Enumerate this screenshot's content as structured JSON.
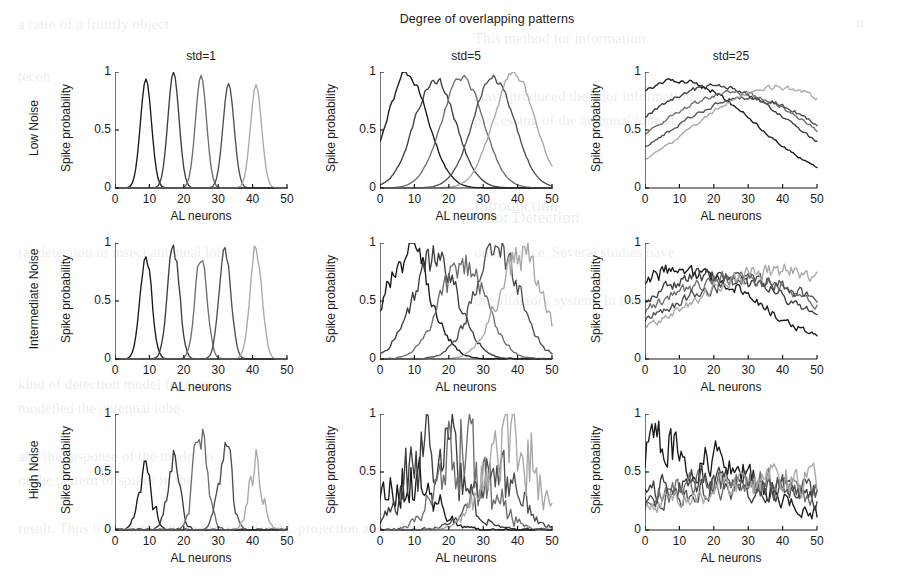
{
  "figure": {
    "title": "Degree of overlapping patterns",
    "columns": [
      {
        "id": "std1",
        "label": "std=1"
      },
      {
        "id": "std5",
        "label": "std=5"
      },
      {
        "id": "std25",
        "label": "std=25"
      }
    ],
    "rows": [
      {
        "id": "low",
        "label": "Low Noise"
      },
      {
        "id": "mid",
        "label": "Intermediate Noise"
      },
      {
        "id": "high",
        "label": "High Noise"
      }
    ],
    "axis": {
      "xlabel": "AL neurons",
      "ylabel": "Spike probability",
      "xticks": [
        0,
        10,
        20,
        30,
        40,
        50
      ],
      "yticks": [
        0,
        0.5,
        1
      ],
      "xlim": [
        0,
        50
      ],
      "ylim": [
        0,
        1
      ]
    },
    "trace_colors": [
      "#1a1a1a",
      "#3d3d3d",
      "#6e6e6e",
      "#4f4f4f",
      "#a8a8a8"
    ],
    "n_traces": 5
  },
  "bleed_text": [
    {
      "text": "a   ratio   of a   fruitfly   object",
      "x": 18,
      "y": 16,
      "size": 15
    },
    {
      "text": "n",
      "x": 856,
      "y": 14,
      "size": 15
    },
    {
      "text": "This  method  for  information",
      "x": 474,
      "y": 30,
      "size": 15
    },
    {
      "text": "tecon",
      "x": 18,
      "y": 68,
      "size": 15
    },
    {
      "text": "Have  produced  the  odor  information",
      "x": 474,
      "y": 88,
      "size": 15
    },
    {
      "text": "processing  of the  antennal  lobe  and",
      "x": 474,
      "y": 112,
      "size": 15
    },
    {
      "text": "Introduction",
      "x": 474,
      "y": 196,
      "size": 17
    },
    {
      "text": "ral  detection  in  insect  antennal  lobe",
      "x": 18,
      "y": 244,
      "size": 15
    },
    {
      "text": "odor  source.  Several  studies  have",
      "x": 474,
      "y": 244,
      "size": 15
    },
    {
      "text": "the  olfactory  system.  In  this  study",
      "x": 474,
      "y": 292,
      "size": 15
    },
    {
      "text": "kind  of  detection  model  for  signals",
      "x": 18,
      "y": 376,
      "size": 15
    },
    {
      "text": "modelled  the  antennal  lobe",
      "x": 18,
      "y": 400,
      "size": 15
    },
    {
      "text": "and  the  response  of  the  model  to",
      "x": 18,
      "y": 448,
      "size": 15
    },
    {
      "text": "of  the  pattern  of  spikes  in  the",
      "x": 18,
      "y": 472,
      "size": 15
    },
    {
      "text": "result.  Thus  it  is  a  fine-tune  expression  for  AL  projection  and  selected",
      "x": 18,
      "y": 520,
      "size": 15
    },
    {
      "text": "Odor  Detection",
      "x": 474,
      "y": 208,
      "size": 17
    }
  ],
  "chart_data": [
    {
      "type": "line",
      "panel": "Low Noise / std=1",
      "row": "Low Noise",
      "column": "std=1",
      "title": "std=1",
      "xlabel": "AL neurons",
      "ylabel": "Spike probability",
      "xlim": [
        0,
        50
      ],
      "ylim": [
        0,
        1
      ],
      "grid": false,
      "legend": false,
      "series": [
        {
          "name": "pattern 1",
          "color": "#1a1a1a",
          "center": 9,
          "sigma": 1.6,
          "amplitude": 0.94,
          "noise": 0.0
        },
        {
          "name": "pattern 2",
          "color": "#3d3d3d",
          "center": 17,
          "sigma": 1.6,
          "amplitude": 1.0,
          "noise": 0.0
        },
        {
          "name": "pattern 3",
          "color": "#6e6e6e",
          "center": 25,
          "sigma": 1.6,
          "amplitude": 0.97,
          "noise": 0.0
        },
        {
          "name": "pattern 4",
          "color": "#4f4f4f",
          "center": 33,
          "sigma": 1.6,
          "amplitude": 0.9,
          "noise": 0.0
        },
        {
          "name": "pattern 5",
          "color": "#a8a8a8",
          "center": 41,
          "sigma": 1.6,
          "amplitude": 0.89,
          "noise": 0.0
        }
      ]
    },
    {
      "type": "line",
      "panel": "Low Noise / std=5",
      "row": "Low Noise",
      "column": "std=5",
      "title": "std=5",
      "xlabel": "AL neurons",
      "ylabel": "Spike probability",
      "xlim": [
        0,
        50
      ],
      "ylim": [
        0,
        1
      ],
      "grid": false,
      "legend": false,
      "series": [
        {
          "name": "pattern 1",
          "color": "#1a1a1a",
          "center": 8,
          "sigma": 6.0,
          "amplitude": 1.0,
          "noise": 0.05
        },
        {
          "name": "pattern 2",
          "color": "#3d3d3d",
          "center": 16,
          "sigma": 6.0,
          "amplitude": 0.95,
          "noise": 0.05
        },
        {
          "name": "pattern 3",
          "color": "#6e6e6e",
          "center": 24,
          "sigma": 6.0,
          "amplitude": 0.97,
          "noise": 0.05
        },
        {
          "name": "pattern 4",
          "color": "#4f4f4f",
          "center": 33,
          "sigma": 6.0,
          "amplitude": 0.97,
          "noise": 0.05
        },
        {
          "name": "pattern 5",
          "color": "#a8a8a8",
          "center": 39,
          "sigma": 6.0,
          "amplitude": 1.0,
          "noise": 0.05
        }
      ]
    },
    {
      "type": "line",
      "panel": "Low Noise / std=25",
      "row": "Low Noise",
      "column": "std=25",
      "title": "std=25",
      "xlabel": "AL neurons",
      "ylabel": "Spike probability",
      "xlim": [
        0,
        50
      ],
      "ylim": [
        0,
        1
      ],
      "grid": false,
      "legend": false,
      "series": [
        {
          "name": "pattern 1",
          "color": "#1a1a1a",
          "center": 10,
          "sigma": 22.0,
          "amplitude": 0.95,
          "noise": 0.09
        },
        {
          "name": "pattern 2",
          "color": "#3d3d3d",
          "center": 20,
          "sigma": 24.0,
          "amplitude": 0.9,
          "noise": 0.09
        },
        {
          "name": "pattern 3",
          "color": "#6e6e6e",
          "center": 26,
          "sigma": 24.0,
          "amplitude": 0.85,
          "noise": 0.09
        },
        {
          "name": "pattern 4",
          "color": "#4f4f4f",
          "center": 30,
          "sigma": 24.0,
          "amplitude": 0.8,
          "noise": 0.09
        },
        {
          "name": "pattern 5",
          "color": "#a8a8a8",
          "center": 38,
          "sigma": 24.0,
          "amplitude": 0.9,
          "noise": 0.09
        }
      ]
    },
    {
      "type": "line",
      "panel": "Intermediate Noise / std=1",
      "row": "Intermediate Noise",
      "column": "std=1",
      "title": "std=1",
      "xlabel": "AL neurons",
      "ylabel": "Spike probability",
      "xlim": [
        0,
        50
      ],
      "ylim": [
        0,
        1
      ],
      "grid": false,
      "legend": false,
      "series": [
        {
          "name": "pattern 1",
          "color": "#1a1a1a",
          "center": 9,
          "sigma": 1.7,
          "amplitude": 0.88,
          "noise": 0.1
        },
        {
          "name": "pattern 2",
          "color": "#3d3d3d",
          "center": 17,
          "sigma": 1.7,
          "amplitude": 1.0,
          "noise": 0.1
        },
        {
          "name": "pattern 3",
          "color": "#6e6e6e",
          "center": 25,
          "sigma": 1.7,
          "amplitude": 0.92,
          "noise": 0.1
        },
        {
          "name": "pattern 4",
          "color": "#4f4f4f",
          "center": 32,
          "sigma": 1.7,
          "amplitude": 0.94,
          "noise": 0.1
        },
        {
          "name": "pattern 5",
          "color": "#a8a8a8",
          "center": 41,
          "sigma": 1.7,
          "amplitude": 0.98,
          "noise": 0.1
        }
      ]
    },
    {
      "type": "line",
      "panel": "Intermediate Noise / std=5",
      "row": "Intermediate Noise",
      "column": "std=5",
      "title": "std=5",
      "xlabel": "AL neurons",
      "ylabel": "Spike probability",
      "xlim": [
        0,
        50
      ],
      "ylim": [
        0,
        1
      ],
      "grid": false,
      "legend": false,
      "series": [
        {
          "name": "pattern 1",
          "color": "#1a1a1a",
          "center": 8,
          "sigma": 6.5,
          "amplitude": 1.0,
          "noise": 0.22
        },
        {
          "name": "pattern 2",
          "color": "#3d3d3d",
          "center": 16,
          "sigma": 6.5,
          "amplitude": 0.95,
          "noise": 0.22
        },
        {
          "name": "pattern 3",
          "color": "#6e6e6e",
          "center": 24,
          "sigma": 6.5,
          "amplitude": 0.9,
          "noise": 0.22
        },
        {
          "name": "pattern 4",
          "color": "#4f4f4f",
          "center": 34,
          "sigma": 6.5,
          "amplitude": 1.0,
          "noise": 0.22
        },
        {
          "name": "pattern 5",
          "color": "#a8a8a8",
          "center": 41,
          "sigma": 6.5,
          "amplitude": 0.95,
          "noise": 0.22
        }
      ]
    },
    {
      "type": "line",
      "panel": "Intermediate Noise / std=25",
      "row": "Intermediate Noise",
      "column": "std=25",
      "title": "std=25",
      "xlabel": "AL neurons",
      "ylabel": "Spike probability",
      "xlim": [
        0,
        50
      ],
      "ylim": [
        0,
        1
      ],
      "grid": false,
      "legend": false,
      "series": [
        {
          "name": "pattern 1",
          "color": "#1a1a1a",
          "center": 10,
          "sigma": 24.0,
          "amplitude": 0.85,
          "noise": 0.3
        },
        {
          "name": "pattern 2",
          "color": "#3d3d3d",
          "center": 20,
          "sigma": 26.0,
          "amplitude": 0.8,
          "noise": 0.3
        },
        {
          "name": "pattern 3",
          "color": "#6e6e6e",
          "center": 26,
          "sigma": 26.0,
          "amplitude": 0.78,
          "noise": 0.3
        },
        {
          "name": "pattern 4",
          "color": "#4f4f4f",
          "center": 30,
          "sigma": 26.0,
          "amplitude": 0.75,
          "noise": 0.3
        },
        {
          "name": "pattern 5",
          "color": "#a8a8a8",
          "center": 38,
          "sigma": 26.0,
          "amplitude": 0.85,
          "noise": 0.3
        }
      ]
    },
    {
      "type": "line",
      "panel": "High Noise / std=1",
      "row": "High Noise",
      "column": "std=1",
      "title": "std=1",
      "xlabel": "AL neurons",
      "ylabel": "Spike probability",
      "xlim": [
        0,
        50
      ],
      "ylim": [
        0,
        1
      ],
      "grid": false,
      "legend": false,
      "series": [
        {
          "name": "pattern 1",
          "color": "#1a1a1a",
          "center": 9,
          "sigma": 2.0,
          "amplitude": 0.52,
          "noise": 0.45
        },
        {
          "name": "pattern 2",
          "color": "#3d3d3d",
          "center": 17,
          "sigma": 2.0,
          "amplitude": 0.58,
          "noise": 0.45
        },
        {
          "name": "pattern 3",
          "color": "#6e6e6e",
          "center": 25,
          "sigma": 2.0,
          "amplitude": 0.95,
          "noise": 0.45
        },
        {
          "name": "pattern 4",
          "color": "#4f4f4f",
          "center": 32,
          "sigma": 2.0,
          "amplitude": 0.7,
          "noise": 0.45
        },
        {
          "name": "pattern 5",
          "color": "#a8a8a8",
          "center": 41,
          "sigma": 2.0,
          "amplitude": 0.57,
          "noise": 0.45
        }
      ]
    },
    {
      "type": "line",
      "panel": "High Noise / std=5",
      "row": "High Noise",
      "column": "std=5",
      "title": "std=5",
      "xlabel": "AL neurons",
      "ylabel": "Spike probability",
      "xlim": [
        0,
        50
      ],
      "ylim": [
        0,
        1
      ],
      "grid": false,
      "legend": false,
      "series": [
        {
          "name": "pattern 1",
          "color": "#1a1a1a",
          "center": 8,
          "sigma": 7.0,
          "amplitude": 0.55,
          "noise": 0.6
        },
        {
          "name": "pattern 2",
          "color": "#3d3d3d",
          "center": 16,
          "sigma": 7.0,
          "amplitude": 1.0,
          "noise": 0.6
        },
        {
          "name": "pattern 3",
          "color": "#6e6e6e",
          "center": 25,
          "sigma": 7.0,
          "amplitude": 0.95,
          "noise": 0.6
        },
        {
          "name": "pattern 4",
          "color": "#4f4f4f",
          "center": 34,
          "sigma": 7.0,
          "amplitude": 0.55,
          "noise": 0.6
        },
        {
          "name": "pattern 5",
          "color": "#a8a8a8",
          "center": 38,
          "sigma": 7.0,
          "amplitude": 0.95,
          "noise": 0.6
        }
      ]
    },
    {
      "type": "line",
      "panel": "High Noise / std=25",
      "row": "High Noise",
      "column": "std=25",
      "title": "std=25",
      "xlabel": "AL neurons",
      "ylabel": "Spike probability",
      "xlim": [
        0,
        50
      ],
      "ylim": [
        0,
        1
      ],
      "grid": false,
      "legend": false,
      "series": [
        {
          "name": "pattern 1",
          "color": "#1a1a1a",
          "center": 4,
          "sigma": 26.0,
          "amplitude": 1.0,
          "noise": 0.8
        },
        {
          "name": "pattern 2",
          "color": "#3d3d3d",
          "center": 20,
          "sigma": 28.0,
          "amplitude": 0.6,
          "noise": 0.8
        },
        {
          "name": "pattern 3",
          "color": "#6e6e6e",
          "center": 26,
          "sigma": 28.0,
          "amplitude": 0.58,
          "noise": 0.8
        },
        {
          "name": "pattern 4",
          "color": "#4f4f4f",
          "center": 30,
          "sigma": 28.0,
          "amplitude": 0.55,
          "noise": 0.8
        },
        {
          "name": "pattern 5",
          "color": "#a8a8a8",
          "center": 38,
          "sigma": 28.0,
          "amplitude": 0.62,
          "noise": 0.8
        }
      ]
    }
  ]
}
